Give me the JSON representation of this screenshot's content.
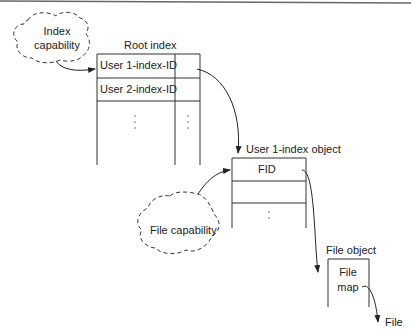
{
  "clouds": {
    "index_capability": {
      "line1": "Index",
      "line2": "capability"
    },
    "file_capability": "File capability"
  },
  "root_index": {
    "title": "Root index",
    "rows": [
      "User 1-index-ID",
      "User 2-index-ID"
    ]
  },
  "user_index_object": {
    "title": "User 1-index object",
    "rows": [
      "FID"
    ]
  },
  "file_object": {
    "title": "File object",
    "line1": "File",
    "line2": "map"
  },
  "file_label": "File"
}
